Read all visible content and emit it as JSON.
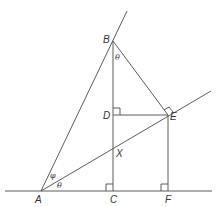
{
  "diagram": {
    "type": "geometry",
    "points": {
      "A": {
        "label": "A",
        "x": 41,
        "y": 191
      },
      "B": {
        "label": "B",
        "x": 113,
        "y": 41
      },
      "C": {
        "label": "C",
        "x": 113,
        "y": 191
      },
      "D": {
        "label": "D",
        "x": 113,
        "y": 115
      },
      "E": {
        "label": "E",
        "x": 168,
        "y": 115
      },
      "F": {
        "label": "F",
        "x": 168,
        "y": 191
      },
      "X": {
        "label": "X",
        "x": 113,
        "y": 146
      }
    },
    "angles": {
      "theta_at_B": "θ",
      "phi_at_A": "φ",
      "theta_at_A": "θ"
    },
    "right_angles": [
      "D",
      "C",
      "F",
      "E"
    ]
  }
}
